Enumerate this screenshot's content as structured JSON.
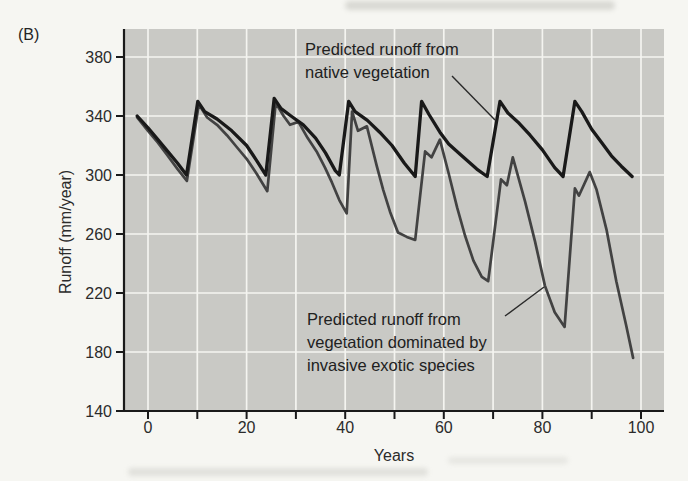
{
  "panel_label": "(B)",
  "annotations": {
    "native": {
      "line1": "Predicted runoff from",
      "line2": "native vegetation"
    },
    "invasive": {
      "line1": "Predicted runoff from",
      "line2": "vegetation dominated by",
      "line3": "invasive exotic species"
    }
  },
  "colors": {
    "page_bg": "#f6f6f2",
    "plot_bg": "#c9c9c5",
    "grid": "#f4f4f0",
    "axis": "#1a1a1a",
    "tick_text": "#2b2b2b",
    "pointer": "#2a2a2a",
    "native_line": "#191919",
    "invasive_line": "#424242"
  },
  "chart_data": {
    "type": "line",
    "title": "",
    "xlabel": "Years",
    "ylabel": "Runoff (mm/year)",
    "xlim": [
      -5,
      104.7
    ],
    "ylim": [
      140,
      399
    ],
    "grid": true,
    "x_gridlines": [
      0,
      10,
      20,
      30,
      40,
      50,
      60,
      70,
      80,
      90,
      100
    ],
    "y_gridlines": [
      180,
      220,
      260,
      300,
      340,
      380
    ],
    "x_ticks": [
      0,
      10,
      20,
      30,
      40,
      50,
      60,
      70,
      80,
      90,
      100
    ],
    "x_tick_labels": [
      0,
      20,
      40,
      60,
      80,
      100
    ],
    "y_ticks": [
      140,
      180,
      220,
      260,
      300,
      340,
      380
    ],
    "y_tick_labels": [
      140,
      180,
      220,
      260,
      300,
      340,
      380
    ],
    "legend_position": "inline-annotations",
    "series": [
      {
        "name": "Predicted runoff from vegetation dominated by invasive exotic species",
        "key": "invasive",
        "points": [
          [
            -2.2,
            339
          ],
          [
            0,
            330
          ],
          [
            2,
            322
          ],
          [
            4,
            313
          ],
          [
            6,
            304
          ],
          [
            7.9,
            296
          ],
          [
            10.3,
            348
          ],
          [
            12,
            339
          ],
          [
            14,
            334
          ],
          [
            16,
            327
          ],
          [
            18,
            319
          ],
          [
            20,
            311
          ],
          [
            22,
            301
          ],
          [
            24.2,
            289
          ],
          [
            25.9,
            349
          ],
          [
            27.5,
            340
          ],
          [
            28.8,
            334
          ],
          [
            30.5,
            336
          ],
          [
            32.4,
            325
          ],
          [
            34.2,
            316
          ],
          [
            35.9,
            305
          ],
          [
            37.3,
            295
          ],
          [
            38.8,
            283
          ],
          [
            40.3,
            274
          ],
          [
            41.4,
            343
          ],
          [
            42.6,
            330
          ],
          [
            44.4,
            333
          ],
          [
            46.4,
            306
          ],
          [
            47.7,
            290
          ],
          [
            49.1,
            275
          ],
          [
            50.7,
            261
          ],
          [
            52.5,
            258
          ],
          [
            54.2,
            256
          ],
          [
            56.2,
            316
          ],
          [
            57.5,
            312
          ],
          [
            59.2,
            324
          ],
          [
            61,
            301
          ],
          [
            62.7,
            278
          ],
          [
            64.3,
            259
          ],
          [
            66,
            242
          ],
          [
            67.7,
            231
          ],
          [
            69,
            228
          ],
          [
            71.6,
            297
          ],
          [
            72.8,
            293
          ],
          [
            74,
            312
          ],
          [
            76.5,
            282
          ],
          [
            78.5,
            255
          ],
          [
            80.5,
            225
          ],
          [
            82.5,
            207
          ],
          [
            84.5,
            197
          ],
          [
            86.6,
            291
          ],
          [
            87.4,
            286
          ],
          [
            89.6,
            302
          ],
          [
            91,
            290
          ],
          [
            93,
            263
          ],
          [
            95,
            228
          ],
          [
            97,
            198
          ],
          [
            98.4,
            176
          ]
        ]
      },
      {
        "name": "Predicted runoff from native vegetation",
        "key": "native",
        "points": [
          [
            -2.2,
            340
          ],
          [
            0,
            332
          ],
          [
            2,
            324
          ],
          [
            4,
            316
          ],
          [
            6,
            308
          ],
          [
            7.8,
            300
          ],
          [
            10.1,
            350
          ],
          [
            11.5,
            343
          ],
          [
            14,
            338
          ],
          [
            17,
            330
          ],
          [
            20,
            320
          ],
          [
            22,
            310
          ],
          [
            23.9,
            300
          ],
          [
            25.6,
            352
          ],
          [
            27,
            345
          ],
          [
            29,
            340
          ],
          [
            31.5,
            334
          ],
          [
            34,
            325
          ],
          [
            36,
            315
          ],
          [
            38,
            303
          ],
          [
            38.8,
            300
          ],
          [
            40.7,
            350
          ],
          [
            42,
            343
          ],
          [
            44.5,
            337
          ],
          [
            47,
            329
          ],
          [
            49.5,
            320
          ],
          [
            52,
            308
          ],
          [
            54.2,
            299
          ],
          [
            55.5,
            350
          ],
          [
            57,
            341
          ],
          [
            59.2,
            329
          ],
          [
            61,
            321
          ],
          [
            63.3,
            314
          ],
          [
            66.7,
            304
          ],
          [
            68.8,
            299
          ],
          [
            71.4,
            350
          ],
          [
            73,
            342
          ],
          [
            75,
            336
          ],
          [
            77.5,
            327
          ],
          [
            80,
            317
          ],
          [
            82.5,
            305
          ],
          [
            84.2,
            299
          ],
          [
            86.6,
            350
          ],
          [
            88,
            343
          ],
          [
            90,
            331
          ],
          [
            92,
            322
          ],
          [
            94,
            313
          ],
          [
            96,
            306
          ],
          [
            98.2,
            299
          ]
        ]
      }
    ]
  }
}
